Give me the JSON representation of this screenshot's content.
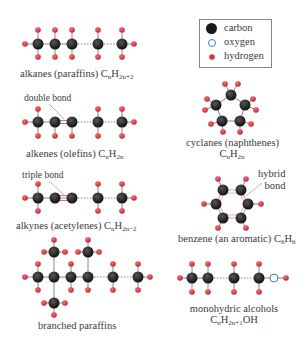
{
  "legend": {
    "items": [
      {
        "label": "carbon",
        "symbol": "carbon-atom-icon",
        "color": "#1a1a1a"
      },
      {
        "label": "oxygen",
        "symbol": "oxygen-atom-icon",
        "color": "#4a7bd0"
      },
      {
        "label": "hydrogen",
        "symbol": "hydrogen-atom-icon",
        "color": "#d9343e"
      }
    ]
  },
  "colors": {
    "carbon": "#1a1a1a",
    "hydrogen": "#d9343e",
    "oxygen_stroke": "#4a7bd0",
    "bond": "#888888",
    "hybrid_bond": "#e8a0a8"
  },
  "molecules": {
    "alkanes": {
      "name": "alkanes (paraffins) C",
      "sub1": "n",
      "mid": "H",
      "sub2": "2n+2"
    },
    "alkenes": {
      "name": "alkenes (olefins) C",
      "sub1": "n",
      "mid": "H",
      "sub2": "2n",
      "annotation": "double bond"
    },
    "alkynes": {
      "name": "alkynes (acetylenes) C",
      "sub1": "n",
      "mid": "H",
      "sub2": "2n−2",
      "annotation": "triple bond"
    },
    "branched": {
      "name": "branched paraffins"
    },
    "cyclanes": {
      "name": "cyclanes (naphthenes)",
      "formula_c": "C",
      "sub1": "n",
      "mid": "H",
      "sub2": "2n"
    },
    "benzene": {
      "name": "benzene (an aromatic) C",
      "sub1": "6",
      "mid": "H",
      "sub2": "6",
      "annotation_line1": "hybrid",
      "annotation_line2": "bond"
    },
    "alcohols": {
      "name": "monohydric alcohols",
      "formula_c": "C",
      "sub1": "n",
      "mid": "H",
      "sub2": "2n+1",
      "tail": "OH"
    }
  }
}
